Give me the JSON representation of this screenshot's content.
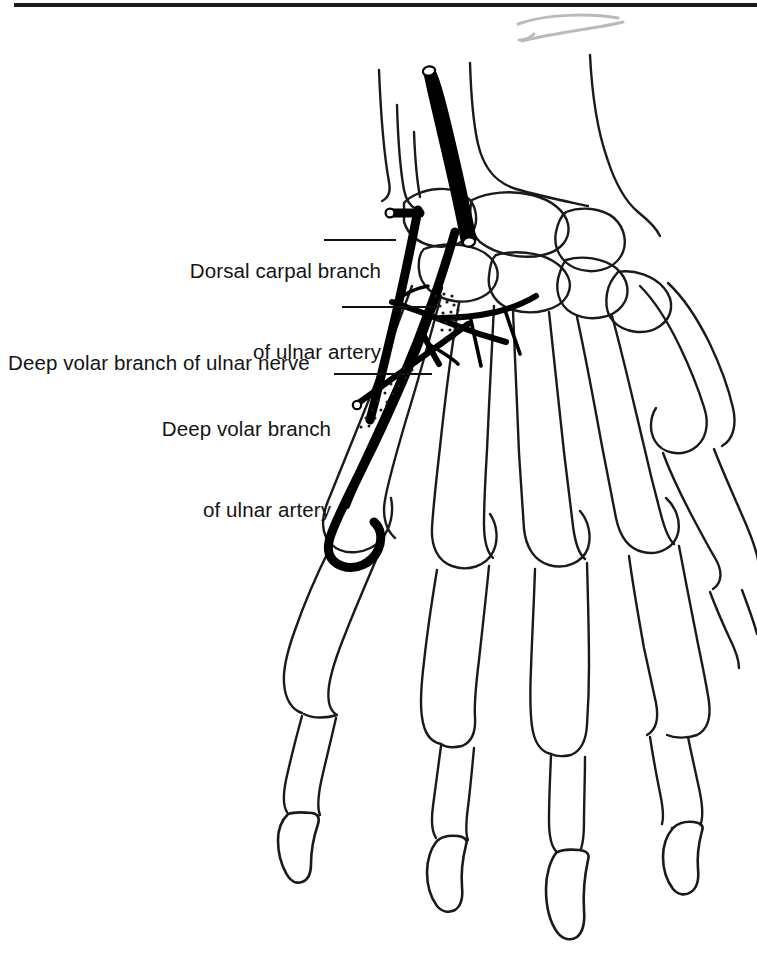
{
  "figure": {
    "kind": "anatomical-line-drawing",
    "background_color": "#ffffff",
    "ink_color": "#1a1a1a",
    "vessel_color": "#000000",
    "sketch_mark_color": "#b9babd",
    "top_rule": {
      "name": "page-rule",
      "color": "#1b1b1f"
    }
  },
  "labels": [
    {
      "id": "dorsal-carpal-branch",
      "lines": [
        "Dorsal carpal branch",
        "of ulnar artery"
      ],
      "line1": "Dorsal carpal branch",
      "line2": "of ulnar artery",
      "align": "right",
      "leader": "horizontal"
    },
    {
      "id": "deep-volar-branch-ulnar-nerve",
      "lines": [
        "Deep volar branch of ulnar nerve"
      ],
      "line1": "Deep volar branch of ulnar nerve",
      "line2": "",
      "align": "left",
      "leader": "horizontal"
    },
    {
      "id": "deep-volar-branch-ulnar-artery",
      "lines": [
        "Deep volar branch",
        "of ulnar artery"
      ],
      "line1": "Deep volar branch",
      "line2": "of ulnar artery",
      "align": "right",
      "leader": "horizontal"
    }
  ],
  "structures": {
    "bones": [
      "ulna",
      "radius",
      "pisiform",
      "triquetrum",
      "lunate",
      "scaphoid",
      "hamate",
      "capitate",
      "trapezoid",
      "trapezium",
      "metacarpal-1",
      "metacarpal-2",
      "metacarpal-3",
      "metacarpal-4",
      "metacarpal-5",
      "proximal-phalanges",
      "middle-phalanges",
      "distal-phalanges"
    ],
    "vessels": [
      "ulnar-artery",
      "dorsal-carpal-branch-of-ulnar-artery",
      "deep-volar-branch-of-ulnar-artery",
      "deep-volar-branch-of-ulnar-nerve",
      "deep-palmar-arch"
    ]
  }
}
